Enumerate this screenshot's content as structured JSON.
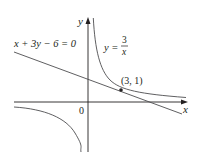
{
  "figure": {
    "type": "function-graph",
    "axes": {
      "x_label": "x",
      "y_label": "y",
      "origin_label": "0"
    },
    "curve": {
      "label_lhs": "y =",
      "label_num": "3",
      "label_den": "x",
      "equation": "y = 3/x"
    },
    "tangent_line": {
      "label": "x + 3y − 6 = 0"
    },
    "point": {
      "label": "(3, 1)",
      "x": 3,
      "y": 1
    },
    "colors": {
      "axis": "#231f20",
      "curve": "#4d4d4f",
      "line": "#4d4d4f",
      "text": "#231f20",
      "background": "#ffffff"
    }
  }
}
